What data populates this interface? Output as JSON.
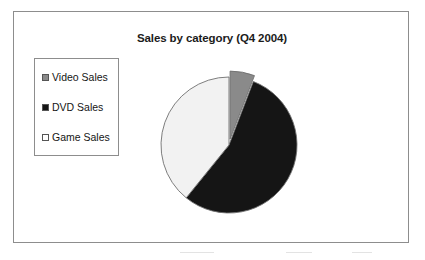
{
  "chart_data": {
    "type": "pie",
    "title": "Sales by category (Q4 2004)",
    "xlabel": "",
    "ylabel": "",
    "legend_position": "left",
    "grid": false,
    "categories": [
      "Video Sales",
      "DVD Sales",
      "Game Sales"
    ],
    "values": [
      6,
      55,
      39
    ],
    "units": "percent",
    "slices": [
      {
        "label": "Video Sales",
        "value": 6,
        "color": "#8a8a8a",
        "exploded": true,
        "start_angle_deg": 0,
        "end_angle_deg": 21
      },
      {
        "label": "DVD Sales",
        "value": 55,
        "color": "#151515",
        "exploded": false,
        "start_angle_deg": 21,
        "end_angle_deg": 219
      },
      {
        "label": "Game Sales",
        "value": 39,
        "color": "#f2f2f2",
        "exploded": false,
        "start_angle_deg": 219,
        "end_angle_deg": 360
      }
    ]
  },
  "frame": {
    "border_color": "#8d8d8d",
    "background": "#ffffff"
  },
  "title": {
    "text": "Sales by category (Q4 2004)"
  },
  "legend": {
    "items": [
      {
        "label": "Video Sales",
        "swatch_color": "#8a8a8a",
        "swatch_name": "legend-swatch-video-sales"
      },
      {
        "label": "DVD Sales",
        "swatch_color": "#151515",
        "swatch_name": "legend-swatch-dvd-sales"
      },
      {
        "label": "Game Sales",
        "swatch_color": "#ffffff",
        "swatch_name": "legend-swatch-game-sales"
      }
    ]
  }
}
